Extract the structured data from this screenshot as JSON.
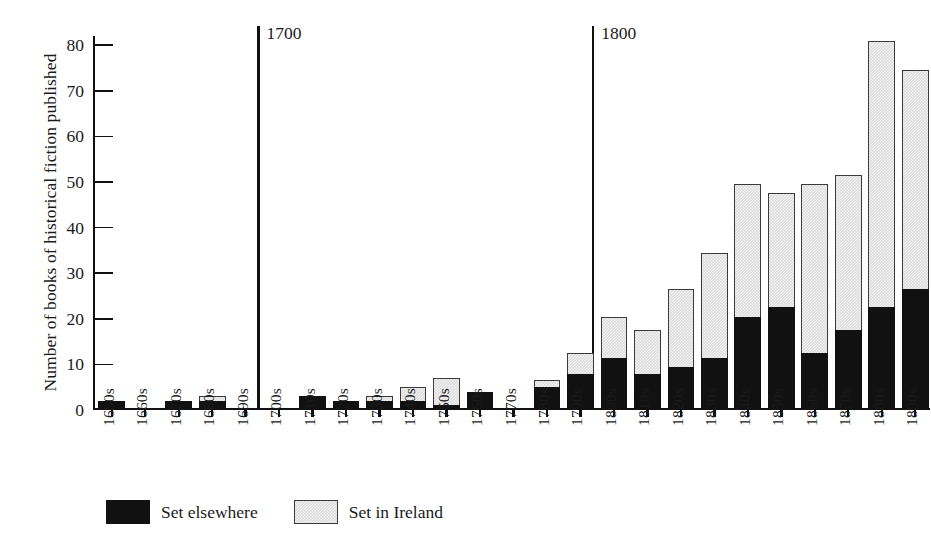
{
  "chart_data": {
    "type": "bar",
    "stacked": true,
    "title": "",
    "xlabel": "",
    "ylabel": "Number of books of historical fiction published",
    "ylim": [
      0,
      82
    ],
    "yticks": [
      0,
      10,
      20,
      30,
      40,
      50,
      60,
      70,
      80
    ],
    "ytick_labels": [
      "0",
      "10",
      "20",
      "30",
      "40",
      "50",
      "60",
      "70",
      "80"
    ],
    "grid": false,
    "legend_position": "bottom-left",
    "categories": [
      "1650s",
      "1660s",
      "1670s",
      "1680s",
      "1690s",
      "1700s",
      "1710s",
      "1720s",
      "1730s",
      "1740s",
      "1750s",
      "1760s",
      "1770s",
      "1780s",
      "1790s",
      "1800s",
      "1810s",
      "1820s",
      "1830s",
      "1840s",
      "1850s",
      "1860s",
      "1870s",
      "1880s",
      "1890s"
    ],
    "series": [
      {
        "name": "Set elsewhere",
        "color": "#111111",
        "values": [
          2,
          0,
          2,
          2,
          0,
          0,
          3,
          2,
          2,
          2,
          1,
          4,
          0,
          5,
          8,
          11.5,
          8,
          9.5,
          11.5,
          20.5,
          22.5,
          12.5,
          17.5,
          22.5,
          26.5
        ]
      },
      {
        "name": "Set in Ireland",
        "color": "#dcdcdc",
        "values": [
          0,
          0,
          0,
          1,
          0,
          0,
          0,
          0,
          1,
          3,
          6,
          0,
          0,
          1.5,
          4.5,
          9,
          9.5,
          17,
          23,
          29,
          25,
          37,
          34,
          58.5,
          48
        ]
      }
    ],
    "totals": [
      2,
      0,
      2,
      3,
      0,
      0,
      3,
      2,
      3,
      5,
      7,
      4,
      0,
      6.5,
      12.5,
      20.5,
      17.5,
      26.5,
      34.5,
      49.5,
      47.5,
      49.5,
      51.5,
      81,
      74.5
    ],
    "annotations": [
      {
        "label": "1700",
        "at_category": "1700s",
        "type": "vertical-rule"
      },
      {
        "label": "1800",
        "at_category": "1800s",
        "type": "vertical-rule"
      }
    ]
  },
  "legend": {
    "items": [
      {
        "label": "Set elsewhere",
        "swatch": "dark"
      },
      {
        "label": "Set in Ireland",
        "swatch": "light"
      }
    ]
  }
}
